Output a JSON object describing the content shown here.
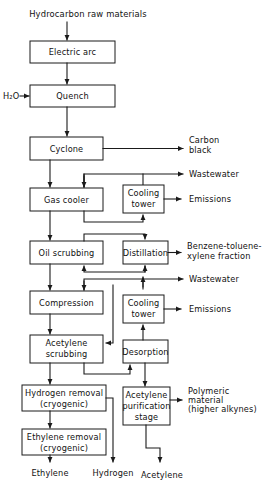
{
  "diagram": {
    "title": "Hydrocarbon raw materials",
    "kind": "process-flow-diagram",
    "colors": {
      "line": "#1a1a1a",
      "box_fill": "#ffffff",
      "background": "#ffffff",
      "text": "#111111"
    },
    "inputs": [
      {
        "id": "feed",
        "label": "Hydrocarbon raw materials"
      },
      {
        "id": "water",
        "label": "H₂O"
      }
    ],
    "nodes": [
      {
        "id": "electric-arc",
        "label": "Electric arc",
        "lines": [
          "Electric arc"
        ]
      },
      {
        "id": "quench",
        "label": "Quench",
        "lines": [
          "Quench"
        ]
      },
      {
        "id": "cyclone",
        "label": "Cyclone",
        "lines": [
          "Cyclone"
        ]
      },
      {
        "id": "gas-cooler",
        "label": "Gas cooler",
        "lines": [
          "Gas cooler"
        ]
      },
      {
        "id": "cooling-tower-1",
        "label": "Cooling tower",
        "lines": [
          "Cooling",
          "tower"
        ]
      },
      {
        "id": "oil-scrubbing",
        "label": "Oil scrubbing",
        "lines": [
          "Oil scrubbing"
        ]
      },
      {
        "id": "distillation",
        "label": "Distillation",
        "lines": [
          "Distillation"
        ]
      },
      {
        "id": "compression",
        "label": "Compression",
        "lines": [
          "Compression"
        ]
      },
      {
        "id": "cooling-tower-2",
        "label": "Cooling tower",
        "lines": [
          "Cooling",
          "tower"
        ]
      },
      {
        "id": "acetylene-scrubbing",
        "label": "Acetylene scrubbing",
        "lines": [
          "Acetylene",
          "scrubbing"
        ]
      },
      {
        "id": "desorption",
        "label": "Desorption",
        "lines": [
          "Desorption"
        ]
      },
      {
        "id": "hydrogen-removal",
        "label": "Hydrogen removal (cryogenic)",
        "lines": [
          "Hydrogen removal",
          "(cryogenic)"
        ]
      },
      {
        "id": "acetylene-purification",
        "label": "Acetylene purification stage",
        "lines": [
          "Acetylene",
          "purification",
          "stage"
        ]
      },
      {
        "id": "ethylene-removal",
        "label": "Ethylene removal (cryogenic)",
        "lines": [
          "Ethylene removal",
          "(cryogenic)"
        ]
      }
    ],
    "outputs": [
      {
        "id": "carbon-black",
        "label": "Carbon black",
        "lines": [
          "Carbon",
          "black"
        ]
      },
      {
        "id": "wastewater-1",
        "label": "Wastewater",
        "lines": [
          "Wastewater"
        ]
      },
      {
        "id": "emissions-1",
        "label": "Emissions",
        "lines": [
          "Emissions"
        ]
      },
      {
        "id": "btx-fraction",
        "label": "Benzene-toluene-xylene fraction",
        "lines": [
          "Benzene-toluene-",
          "xylene fraction"
        ]
      },
      {
        "id": "wastewater-2",
        "label": "Wastewater",
        "lines": [
          "Wastewater"
        ]
      },
      {
        "id": "emissions-2",
        "label": "Emissions",
        "lines": [
          "Emissions"
        ]
      },
      {
        "id": "polymeric-material",
        "label": "Polymeric material (higher alkynes)",
        "lines": [
          "Polymeric",
          "material",
          "(higher alkynes)"
        ]
      },
      {
        "id": "ethylene",
        "label": "Ethylene",
        "lines": [
          "Ethylene"
        ]
      },
      {
        "id": "hydrogen",
        "label": "Hydrogen",
        "lines": [
          "Hydrogen"
        ]
      },
      {
        "id": "acetylene",
        "label": "Acetylene",
        "lines": [
          "Acetylene"
        ]
      }
    ]
  }
}
